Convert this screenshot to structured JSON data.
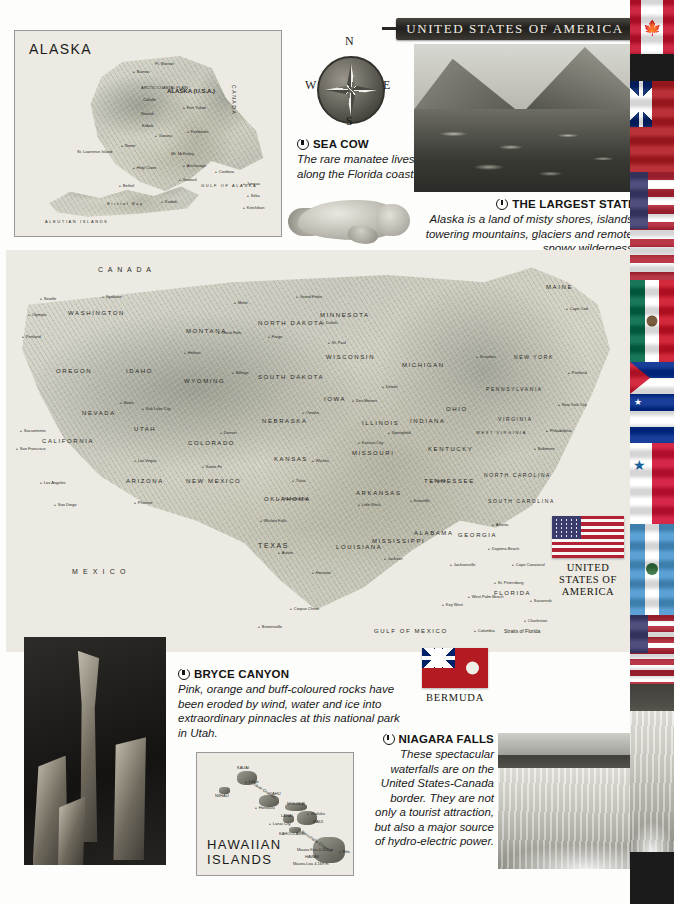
{
  "page": {
    "title": "UNITED STATES OF AMERICA",
    "background_color": "#fdfdfb",
    "banner_color": "#2b2823",
    "accent_text_color": "#141414"
  },
  "compass": {
    "north": "N",
    "east": "E",
    "south": "S",
    "west": "W"
  },
  "insets": {
    "alaska": {
      "label": "ALASKA",
      "country_label": "CANADA",
      "main_label": "ALASKA (U.S.A.)",
      "ocean_label": "ALEUTIAN ISLANDS",
      "places": [
        "Pt. Barrow",
        "Barrow",
        "ARCTIC COASTAL PLAIN",
        "Colville",
        "BROOKS RANGE",
        "Noatak",
        "Kobuk",
        "Fort Yukon",
        "Porcupine",
        "Kotzebue Sound",
        "Yukon",
        "Tanana",
        "Fairbanks",
        "Nome",
        "St. Lawrence Island",
        "Mt. McKinley",
        "Anchorage",
        "Holy Cross",
        "Cordova",
        "Seward",
        "GULF OF ALASKA",
        "Bethel",
        "Bristol Bay",
        "Kodiak",
        "Kodiak Island",
        "Juneau",
        "Sitka",
        "Ketchikan",
        "Unalaska",
        "Pribilof Islands"
      ]
    },
    "hawaii": {
      "label_line1": "HAWAIIAN",
      "label_line2": "ISLANDS",
      "places": [
        "KAUAI",
        "Lihue",
        "NIIHAU",
        "Kauai Channel",
        "OAHU",
        "Honolulu",
        "MOLOKAI",
        "LANAI",
        "Lanai City",
        "Wailuku",
        "MAUI",
        "KAHOOLAWE",
        "Alenuihaha Channel",
        "Mauna Kea 4,205 m",
        "HAWAII",
        "Hilo",
        "Mauna Loa 4,169 m"
      ]
    }
  },
  "main_map": {
    "country_label_north": "C A N A D A",
    "country_label_south": "M E X I C O",
    "gulf_label": "GULF OF MEXICO",
    "straits_label": "Straits of Florida",
    "states": [
      "WASHINGTON",
      "OREGON",
      "IDAHO",
      "MONTANA",
      "NORTH DAKOTA",
      "SOUTH DAKOTA",
      "MINNESOTA",
      "WISCONSIN",
      "MICHIGAN",
      "WYOMING",
      "NEBRASKA",
      "IOWA",
      "ILLINOIS",
      "INDIANA",
      "OHIO",
      "PENNSYLVANIA",
      "NEW YORK",
      "MAINE",
      "NEVADA",
      "UTAH",
      "COLORADO",
      "KANSAS",
      "MISSOURI",
      "KENTUCKY",
      "WEST VIRGINIA",
      "VIRGINIA",
      "MARYLAND",
      "NEW JERSEY",
      "CALIFORNIA",
      "ARIZONA",
      "NEW MEXICO",
      "OKLAHOMA",
      "ARKANSAS",
      "TENNESSEE",
      "NORTH CAROLINA",
      "SOUTH CAROLINA",
      "GEORGIA",
      "ALABAMA",
      "MISSISSIPPI",
      "LOUISIANA",
      "TEXAS",
      "FLORIDA",
      "VERMONT",
      "NEW HAMPSHIRE",
      "MASSACHUSETTS",
      "CONNECTICUT",
      "RHODE ISLAND",
      "DELAWARE"
    ],
    "cities": [
      "Seattle",
      "Spokane",
      "Olympia",
      "Portland",
      "Salem",
      "Eugene",
      "Boise",
      "Helena",
      "Great Falls",
      "Billings",
      "Havre",
      "Williston",
      "Minot",
      "Grand Forks",
      "Bismarck",
      "Fargo",
      "Duluth",
      "Marquette",
      "St. Paul",
      "Minneapolis",
      "Green Bay",
      "La Crosse",
      "Rapid City",
      "Sioux Falls",
      "Sioux City",
      "Cedar Rapids",
      "Des Moines",
      "Davenport",
      "Omaha",
      "Lincoln",
      "Grand Island",
      "North Platte",
      "Cheyenne",
      "Denver",
      "Colorado Springs",
      "Pueblo",
      "Salt Lake City",
      "Ogden",
      "Provo",
      "Reno",
      "Carson City",
      "Las Vegas",
      "Sacramento",
      "San Francisco",
      "Oakland",
      "San Jose",
      "Fresno",
      "Bakersfield",
      "Los Angeles",
      "Long Beach",
      "San Diego",
      "San Bernardino",
      "Flagstaff",
      "Phoenix",
      "Tucson",
      "Yuma",
      "El Paso",
      "Albuquerque",
      "Santa Fe",
      "Roswell",
      "Amarillo",
      "Lubbock",
      "Abilene",
      "Wichita Falls",
      "Dallas",
      "Fort Worth",
      "Waco",
      "Austin",
      "San Antonio",
      "Houston",
      "Galveston",
      "Corpus Christi",
      "Brownsville",
      "Laredo",
      "Odessa",
      "Midland",
      "Oklahoma City",
      "Tulsa",
      "Wichita",
      "Hutchinson",
      "Topeka",
      "Salina",
      "Kansas City",
      "Springfield",
      "St. Louis",
      "Joplin",
      "Little Rock",
      "Fort Smith",
      "Texarkana",
      "Shreveport",
      "Alexandria",
      "Baton Rouge",
      "New Orleans",
      "Lafayette",
      "Port Arthur",
      "Beaumont",
      "Jackson",
      "Meridian",
      "Vicksburg",
      "Greenville",
      "Memphis",
      "Nashville",
      "Chattanooga",
      "Knoxville",
      "Tupelo",
      "Birmingham",
      "Montgomery",
      "Mobile",
      "Pensacola",
      "Tallahassee",
      "Jacksonville",
      "St. Augustine",
      "Daytona Beach",
      "Orlando",
      "Cape Canaveral",
      "Tampa",
      "St. Petersburg",
      "Fort Myers",
      "West Palm Beach",
      "Miami",
      "Key West",
      "Savannah",
      "Charleston",
      "Columbia",
      "Augusta",
      "Atlanta",
      "Macon",
      "Columbus",
      "Greensboro",
      "Charlotte",
      "Raleigh",
      "Wilmington",
      "Cape Hatteras",
      "Norfolk",
      "Richmond",
      "Roanoke",
      "Washington D.C.",
      "Baltimore",
      "Philadelphia",
      "Atlantic City",
      "New York City",
      "Newark",
      "Albany",
      "Buffalo",
      "Rochester",
      "Syracuse",
      "Scranton",
      "Pittsburgh",
      "Cleveland",
      "Columbus",
      "Cincinnati",
      "Indianapolis",
      "Chicago",
      "Milwaukee",
      "Detroit",
      "Lansing",
      "Toledo",
      "Grand Rapids",
      "Fort Wayne",
      "Louisville",
      "Lexington",
      "Boston",
      "Providence",
      "Hartford",
      "Portland",
      "Augusta",
      "Bangor",
      "Concord",
      "Montpelier",
      "Cape Cod",
      "Long Island",
      "Windsor",
      "Chesapeake Bay"
    ],
    "water_features": [
      "Columbia",
      "Snake",
      "Missouri",
      "Mississippi",
      "Ohio",
      "Arkansas",
      "Red",
      "Rio Grande",
      "Colorado",
      "Platte",
      "Tennessee",
      "Lake Superior",
      "Lake Michigan",
      "Lake Huron",
      "Lake Erie",
      "Lake Ontario",
      "Great Salt Lake",
      "ATLANTIC OCEAN",
      "PACIFIC OCEAN"
    ]
  },
  "captions": {
    "sea_cow": {
      "icon": "camera-bullet-icon",
      "title": "SEA COW",
      "body": "The rare manatee lives along the Florida coast."
    },
    "largest_state": {
      "icon": "camera-bullet-icon",
      "title": "THE LARGEST STATE",
      "body": "Alaska is a land of misty shores, islands, towering mountains, glaciers and remote, snowy wilderness."
    },
    "bryce_canyon": {
      "icon": "camera-bullet-icon",
      "title": "BRYCE CANYON",
      "body": "Pink, orange and buff-coloured rocks have been eroded by wind, water and ice into extraordinary pinnacles at this national park in Utah."
    },
    "niagara_falls": {
      "icon": "camera-bullet-icon",
      "title": "NIAGARA FALLS",
      "body": "These spectacular waterfalls are on the United States-Canada border. They are not only a tourist attraction, but also a major source of hydro-electric power."
    }
  },
  "flags": {
    "usa": {
      "label_line1": "UNITED",
      "label_line2": "STATES OF",
      "label_line3": "AMERICA"
    },
    "bermuda": {
      "label": "BERMUDA"
    },
    "strip": [
      {
        "name": "canada-flag"
      },
      {
        "name": "bermuda-ensign-flag"
      },
      {
        "name": "united-states-flag"
      },
      {
        "name": "mexico-flag"
      },
      {
        "name": "cuba-flag"
      },
      {
        "name": "panama-flag"
      },
      {
        "name": "bahamas-flag"
      },
      {
        "name": "guatemala-flag"
      },
      {
        "name": "honduras-flag"
      }
    ]
  },
  "photos": {
    "alaska": {
      "name": "alaska-mountain-lake-photo"
    },
    "bryce": {
      "name": "bryce-canyon-hoodoo-photo"
    },
    "niagara": {
      "name": "niagara-falls-photo"
    }
  }
}
